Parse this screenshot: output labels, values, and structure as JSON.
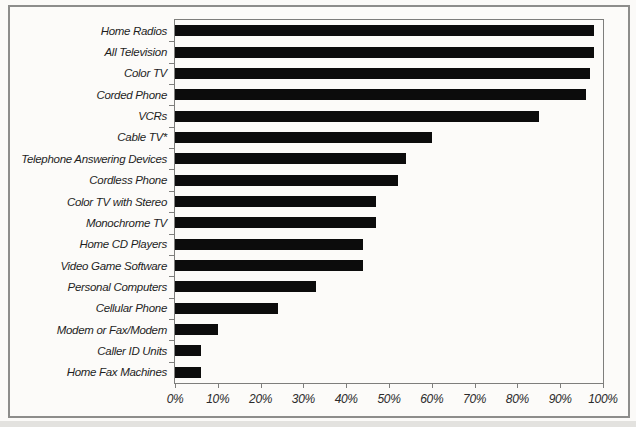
{
  "chart_data": {
    "type": "bar",
    "orientation": "horizontal",
    "title": "",
    "xlabel": "",
    "ylabel": "",
    "xlim": [
      0,
      100
    ],
    "grid": "off",
    "legend": "none",
    "bar_color": "#0c0c0c",
    "axis_color": "#7e7e7c",
    "frame_color": "#8d8d8b",
    "categories": [
      "Home Radios",
      "All Television",
      "Color TV",
      "Corded Phone",
      "VCRs",
      "Cable TV*",
      "Telephone Answering Devices",
      "Cordless Phone",
      "Color TV with Stereo",
      "Monochrome TV",
      "Home CD Players",
      "Video Game Software",
      "Personal Computers",
      "Cellular Phone",
      "Modem or Fax/Modem",
      "Caller ID Units",
      "Home Fax Machines"
    ],
    "values": [
      98,
      98,
      97,
      96,
      85,
      60,
      54,
      52,
      47,
      47,
      44,
      44,
      33,
      24,
      10,
      6,
      6
    ],
    "unit": "%",
    "x_ticks": [
      "0%",
      "10%",
      "20%",
      "30%",
      "40%",
      "50%",
      "60%",
      "70%",
      "80%",
      "90%",
      "100%"
    ],
    "x_tick_values": [
      0,
      10,
      20,
      30,
      40,
      50,
      60,
      70,
      80,
      90,
      100
    ]
  }
}
